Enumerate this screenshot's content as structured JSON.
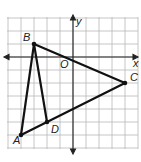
{
  "diagram": {
    "type": "coordinate-plane-triangle",
    "grid": {
      "x_min": -5,
      "x_max": 5,
      "y_min": -7,
      "y_max": 3,
      "step": 1
    },
    "axes": {
      "x_label": "x",
      "y_label": "y",
      "origin_label": "O"
    },
    "points": [
      {
        "name": "A",
        "x": -4,
        "y": -6
      },
      {
        "name": "B",
        "x": -3,
        "y": 1
      },
      {
        "name": "C",
        "x": 4,
        "y": -2
      },
      {
        "name": "D",
        "x": -2,
        "y": -5
      }
    ],
    "segments": [
      [
        "A",
        "B"
      ],
      [
        "B",
        "C"
      ],
      [
        "C",
        "A"
      ],
      [
        "B",
        "D"
      ]
    ],
    "colors": {
      "grid": "#b8b8b8",
      "line": "#111111",
      "background": "#ffffff"
    }
  }
}
